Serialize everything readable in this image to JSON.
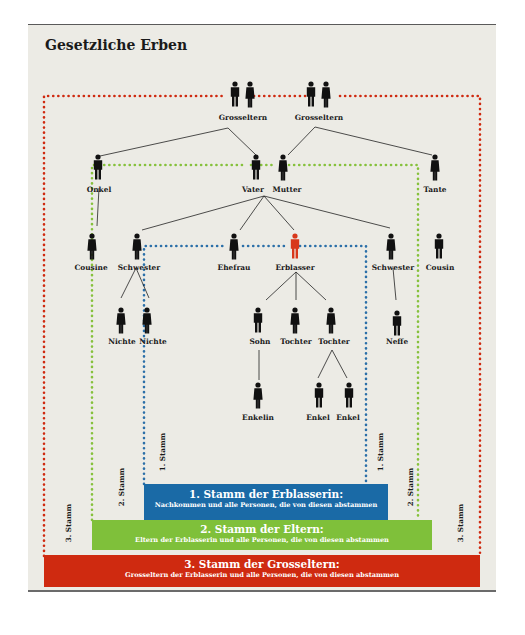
{
  "title": "Gesetzliche Erben",
  "colors": {
    "stamm1": "#1a6aa6",
    "stamm2": "#7fc03a",
    "stamm3": "#cf2a10",
    "erblasser": "#d8371a",
    "person": "#111111",
    "background": "#ecebe5"
  },
  "people": {
    "grosseltern_left": "Grosseltern",
    "grosseltern_right": "Grosseltern",
    "onkel": "Onkel",
    "vater": "Vater",
    "mutter": "Mutter",
    "tante": "Tante",
    "cousine": "Cousine",
    "schwester_left": "Schwester",
    "ehefrau": "Ehefrau",
    "erblasser": "Erblasser",
    "schwester_right": "Schwester",
    "cousin": "Cousin",
    "nichte_1": "Nichte",
    "nichte_2": "Nichte",
    "sohn": "Sohn",
    "tochter_1": "Tochter",
    "tochter_2": "Tochter",
    "neffe": "Neffe",
    "enkelin": "Enkelin",
    "enkel_1": "Enkel",
    "enkel_2": "Enkel"
  },
  "side_labels": {
    "stamm1": "1. Stamm",
    "stamm2": "2. Stamm",
    "stamm3": "3. Stamm"
  },
  "bands": [
    {
      "heading": "1. Stamm der Erblasserin:",
      "sub": "Nachkommen und alle Personen, die von diesen abstammen"
    },
    {
      "heading": "2. Stamm der Eltern:",
      "sub": "Eltern der Erblasserin und alle Personen, die von diesen abstammen"
    },
    {
      "heading": "3. Stamm der Grosseltern:",
      "sub": "Grosseltern der Erblasserin und alle Personen, die von diesen abstammen"
    }
  ]
}
